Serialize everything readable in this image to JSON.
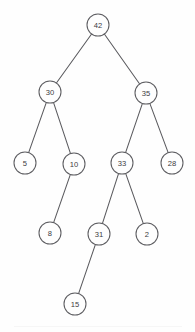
{
  "diagram": {
    "type": "node-link-tree",
    "canvas": {
      "width": 195,
      "height": 332,
      "background": "#fefefe"
    },
    "style": {
      "node_fill": "#fefefe",
      "node_stroke": "#5d5d61",
      "edge_stroke": "#5a5a5e",
      "label_color": "#3b3b3f",
      "node_radius": 11
    },
    "nodes": [
      {
        "id": "n42",
        "label": "42",
        "x": 98,
        "y": 25,
        "level": 0
      },
      {
        "id": "n30",
        "label": "30",
        "x": 50,
        "y": 92,
        "level": 1
      },
      {
        "id": "n35",
        "label": "35",
        "x": 146,
        "y": 93,
        "level": 1
      },
      {
        "id": "n5",
        "label": "5",
        "x": 25,
        "y": 163,
        "level": 2
      },
      {
        "id": "n10",
        "label": "10",
        "x": 74,
        "y": 164,
        "level": 2
      },
      {
        "id": "n33",
        "label": "33",
        "x": 122,
        "y": 163,
        "level": 2
      },
      {
        "id": "n28",
        "label": "28",
        "x": 172,
        "y": 163,
        "level": 2
      },
      {
        "id": "n8",
        "label": "8",
        "x": 50,
        "y": 233,
        "level": 3
      },
      {
        "id": "n31",
        "label": "31",
        "x": 99,
        "y": 234,
        "level": 3
      },
      {
        "id": "n2",
        "label": "2",
        "x": 147,
        "y": 234,
        "level": 3
      },
      {
        "id": "n15",
        "label": "15",
        "x": 75,
        "y": 304,
        "level": 4
      }
    ],
    "edges": [
      {
        "from": "n42",
        "to": "n30"
      },
      {
        "from": "n42",
        "to": "n35"
      },
      {
        "from": "n30",
        "to": "n5"
      },
      {
        "from": "n30",
        "to": "n10"
      },
      {
        "from": "n35",
        "to": "n33"
      },
      {
        "from": "n35",
        "to": "n28"
      },
      {
        "from": "n10",
        "to": "n8"
      },
      {
        "from": "n33",
        "to": "n31"
      },
      {
        "from": "n33",
        "to": "n2"
      },
      {
        "from": "n31",
        "to": "n15"
      }
    ]
  }
}
